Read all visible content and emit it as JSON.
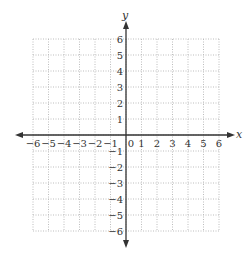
{
  "chart_data": {
    "type": "scatter",
    "title": "",
    "xlabel": "x",
    "ylabel": "y",
    "xlim": [
      -6,
      6
    ],
    "ylim": [
      -6,
      6
    ],
    "grid": true,
    "grid_style": "dotted",
    "x_ticks": [
      "-6",
      "-5",
      "-4",
      "-3",
      "-2",
      "-1",
      "0",
      "1",
      "2",
      "3",
      "4",
      "5",
      "6"
    ],
    "y_ticks": [
      "6",
      "5",
      "4",
      "3",
      "2",
      "1",
      "-1",
      "-2",
      "-3",
      "-4",
      "-5",
      "-6"
    ],
    "series": [],
    "legend": null
  },
  "colors": {
    "axis": "#333333",
    "grid": "#bdbdbd",
    "text": "#333333",
    "background": "#ffffff"
  },
  "layout": {
    "grid_left": 33,
    "grid_top": 39,
    "cell_w": 15.5,
    "cell_h": 16,
    "origin_x": 126,
    "origin_y": 135
  }
}
